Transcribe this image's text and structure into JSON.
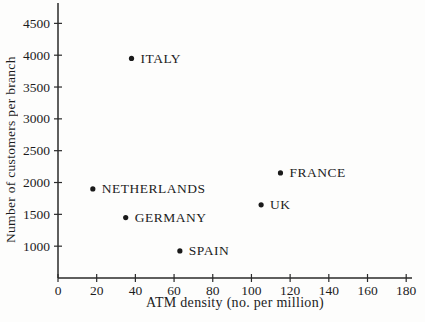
{
  "figure": {
    "background": "#fdfdfc",
    "axis_color": "#2a2a2a",
    "text_color": "#1c1c1c",
    "point_color": "#1a1a1a"
  },
  "chart_data": {
    "type": "scatter",
    "title": "",
    "xlabel": "ATM density (no. per million)",
    "ylabel": "Number of customers per branch",
    "xlim": [
      0,
      183
    ],
    "ylim": [
      500,
      4820
    ],
    "x_ticks": [
      0,
      20,
      40,
      60,
      80,
      100,
      120,
      140,
      160,
      180
    ],
    "y_ticks": [
      1000,
      1500,
      2000,
      2500,
      3000,
      3500,
      4000,
      4500
    ],
    "grid": false,
    "legend": "none",
    "points": [
      {
        "label": "ITALY",
        "x": 38,
        "y": 3950
      },
      {
        "label": "FRANCE",
        "x": 115,
        "y": 2150
      },
      {
        "label": "NETHERLANDS",
        "x": 18,
        "y": 1900
      },
      {
        "label": "UK",
        "x": 105,
        "y": 1650
      },
      {
        "label": "GERMANY",
        "x": 35,
        "y": 1450
      },
      {
        "label": "SPAIN",
        "x": 63,
        "y": 925
      }
    ]
  }
}
